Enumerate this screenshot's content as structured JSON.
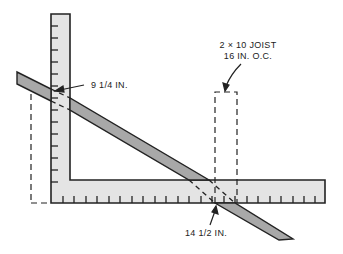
{
  "diagram": {
    "labels": {
      "rise": "9 1/4 IN.",
      "joist_line1": "2 × 10 JOIST",
      "joist_line2": "16 IN. O.C.",
      "run": "14 1/2 IN."
    },
    "colors": {
      "square_fill": "#e4e4e4",
      "rafter_fill": "#a8a8a8",
      "stroke": "#222222",
      "background": "#ffffff"
    },
    "parts": [
      "framing-square",
      "rafter",
      "joist-outline",
      "rise-arrow",
      "run-arrow",
      "joist-arrow"
    ]
  }
}
